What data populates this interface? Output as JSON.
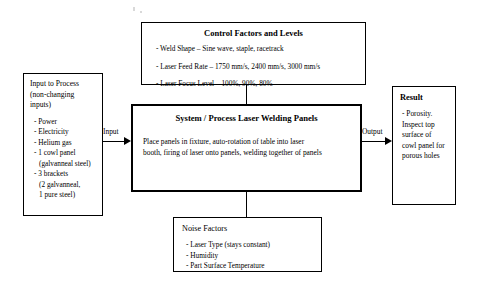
{
  "diagram": {
    "type": "P-diagram / IPO process block diagram"
  },
  "control_factors": {
    "title": "Control Factors and Levels",
    "items": [
      "- Weld Shape – Sine wave, staple, racetrack",
      "- Laser Feed Rate – 1750 mm/s, 2400 mm/s, 3000 mm/s",
      "- Laser Focus Level – 100%, 90%, 80%"
    ]
  },
  "input_to_process": {
    "title": "Input to Process\n(non-changing\ninputs)",
    "items": [
      "- Power",
      "- Electricity",
      "- Helium gas",
      "- 1 cowl panel",
      "(galvanneal steel)",
      "- 3 brackets",
      "(2 galvanneal,",
      "1 pure steel)"
    ]
  },
  "system_process": {
    "title": "System / Process Laser Welding Panels",
    "body": "Place panels in fixture, auto-rotation of table into laser\nbooth,  firing of laser onto panels, welding together of panels"
  },
  "result": {
    "title": "Result",
    "body": "- Porosity.\nInspect top\nsurface of\ncowl panel for\nporous holes"
  },
  "noise_factors": {
    "title": "Noise Factors",
    "items": [
      "- Laser Type (stays constant)",
      "- Humidity",
      "- Part Surface Temperature"
    ]
  },
  "edges": {
    "input_label": "Input",
    "output_label": "Output"
  },
  "colors": {
    "line": "#000000",
    "background": "#ffffff",
    "text": "#000000"
  }
}
